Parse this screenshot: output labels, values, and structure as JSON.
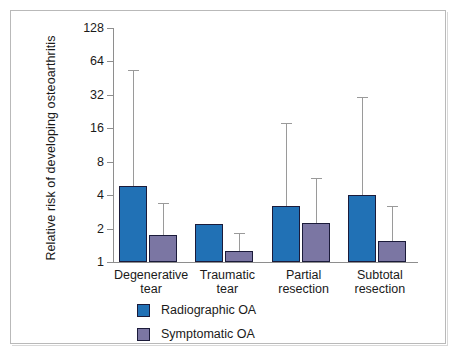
{
  "figure": {
    "background_color": "#ffffff",
    "frame_color": "#b9b9b9"
  },
  "chart_data": {
    "type": "bar",
    "title": "",
    "subtitle": "",
    "xlabel": "",
    "ylabel": "Relative risk of developing osteoarthritis",
    "yscale": "log2",
    "ylim": [
      1,
      128
    ],
    "ytick_labels": [
      "1",
      "2",
      "4",
      "8",
      "16",
      "32",
      "64",
      "128"
    ],
    "ytick_values": [
      1,
      2,
      4,
      8,
      16,
      32,
      64,
      128
    ],
    "grid": false,
    "legend_position": "bottom-left",
    "categories": [
      "Degenerative tear",
      "Traumatic tear",
      "Partial resection",
      "Subtotal resection"
    ],
    "category_lines": [
      [
        "Degenerative",
        "tear"
      ],
      [
        "Traumatic",
        "tear"
      ],
      [
        "Partial",
        "resection"
      ],
      [
        "Subtotal",
        "resection"
      ]
    ],
    "series": [
      {
        "name": "Radiographic OA",
        "color": "#2171b5",
        "values": [
          4.8,
          2.2,
          3.2,
          4.0
        ],
        "error_high": [
          52.0,
          2.2,
          17.5,
          30.0
        ],
        "error_low": [
          4.8,
          2.2,
          3.2,
          4.0
        ]
      },
      {
        "name": "Symptomatic OA",
        "color": "#7b76a3",
        "values": [
          1.75,
          1.25,
          2.25,
          1.55
        ],
        "error_high": [
          3.3,
          1.8,
          5.6,
          3.1
        ],
        "error_low": [
          1.75,
          1.25,
          2.25,
          1.55
        ]
      }
    ]
  },
  "legend": {
    "items": [
      {
        "label": "Radiographic OA",
        "color": "#2171b5",
        "key": "radiographic"
      },
      {
        "label": "Symptomatic OA",
        "color": "#7b76a3",
        "key": "symptomatic"
      }
    ]
  }
}
